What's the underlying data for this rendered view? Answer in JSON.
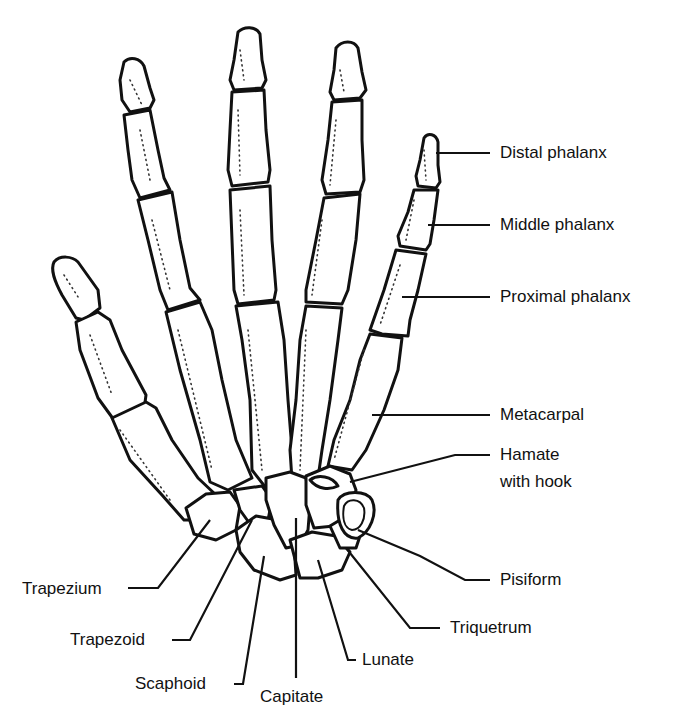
{
  "colors": {
    "outline": "#111111",
    "background": "#ffffff"
  },
  "labels": {
    "distal_phalanx": "Distal phalanx",
    "middle_phalanx": "Middle phalanx",
    "proximal_phalanx": "Proximal phalanx",
    "metacarpal": "Metacarpal",
    "hamate_line1": "Hamate",
    "hamate_line2": "with hook",
    "pisiform": "Pisiform",
    "triquetrum": "Triquetrum",
    "lunate": "Lunate",
    "capitate": "Capitate",
    "scaphoid": "Scaphoid",
    "trapezoid": "Trapezoid",
    "trapezium": "Trapezium"
  }
}
